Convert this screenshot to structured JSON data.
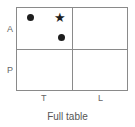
{
  "rows": [
    "A",
    "P"
  ],
  "columns": [
    "T",
    "L"
  ],
  "markers": [
    {
      "type": "dot",
      "cell": "A-T",
      "symbol": "●"
    },
    {
      "type": "star",
      "cell": "A-T",
      "symbol": "★"
    },
    {
      "type": "dot",
      "cell": "A-T",
      "symbol": "●"
    }
  ],
  "caption": "Full table"
}
